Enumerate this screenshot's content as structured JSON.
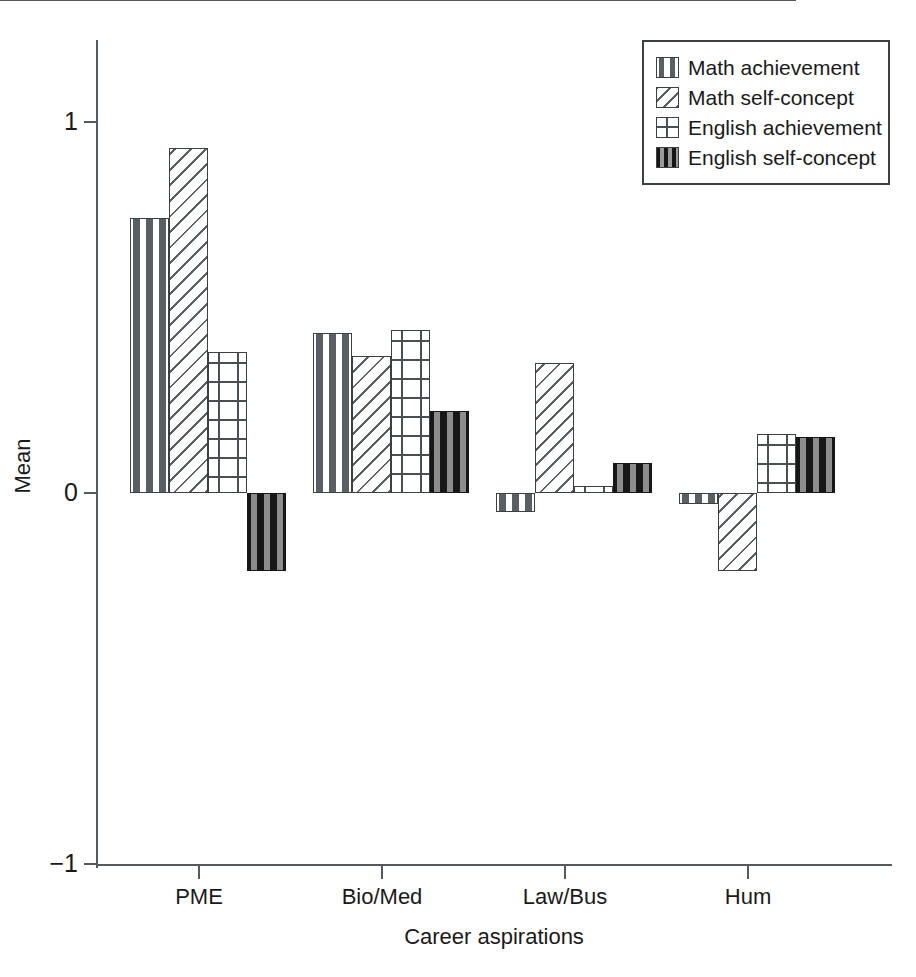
{
  "chart_data": {
    "type": "bar",
    "title": "",
    "xlabel": "Career aspirations",
    "ylabel": "Mean",
    "categories": [
      "PME",
      "Bio/Med",
      "Law/Bus",
      "Hum"
    ],
    "ylim": [
      -1,
      1
    ],
    "yticks": [
      1,
      0,
      -1
    ],
    "ytick_labels": [
      "1",
      "0",
      "−1"
    ],
    "grid": false,
    "legend_position": "top-right",
    "series": [
      {
        "name": "Math achievement",
        "pattern": "dashed-dots-on-white",
        "values": [
          0.74,
          0.43,
          -0.05,
          -0.03
        ]
      },
      {
        "name": "Math self-concept",
        "pattern": "diagonal-hatch",
        "values": [
          0.93,
          0.37,
          0.35,
          -0.21
        ]
      },
      {
        "name": "English achievement",
        "pattern": "plus-signs",
        "values": [
          0.38,
          0.44,
          0.02,
          0.16
        ]
      },
      {
        "name": "English self-concept",
        "pattern": "black-with-dashes",
        "values": [
          -0.21,
          0.22,
          0.08,
          0.15
        ]
      }
    ]
  },
  "axes": {
    "y_title": "Mean",
    "x_title": "Career aspirations",
    "y_ticks": [
      {
        "label": "1",
        "value": 1
      },
      {
        "label": "0",
        "value": 0
      },
      {
        "label": "−1",
        "value": -1
      }
    ],
    "x_ticks": [
      {
        "label": "PME"
      },
      {
        "label": "Bio/Med"
      },
      {
        "label": "Law/Bus"
      },
      {
        "label": "Hum"
      }
    ]
  },
  "legend": {
    "items": [
      {
        "label": "Math achievement",
        "swatch": "pat-dash"
      },
      {
        "label": "Math self-concept",
        "swatch": "pat-hatch"
      },
      {
        "label": "English achievement",
        "swatch": "pat-plus"
      },
      {
        "label": "English self-concept",
        "swatch": "pat-black"
      }
    ]
  },
  "colors": {
    "axis": "#555a5e",
    "bar_outline": "#3c4043",
    "pattern_ink": "#5a5f63",
    "solid_fill": "#171717",
    "background": "#ffffff"
  }
}
